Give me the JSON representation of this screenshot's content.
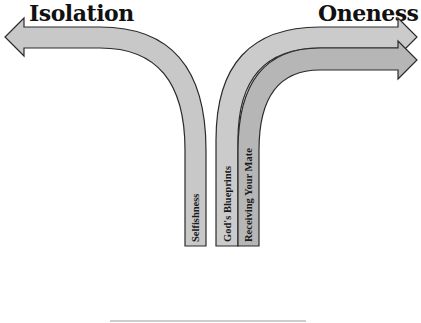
{
  "diagram": {
    "left_goal": "Isolation",
    "right_goal": "Oneness",
    "paths": [
      {
        "label": "Selfishness",
        "direction": "left",
        "leads_to": "Isolation"
      },
      {
        "label": "God's Blueprints",
        "direction": "right",
        "leads_to": "Oneness"
      },
      {
        "label": "Receiving Your Mate",
        "direction": "right",
        "leads_to": "Oneness"
      }
    ]
  },
  "colors": {
    "arrow_fill_light": "#c8c8c8",
    "arrow_fill_dark": "#b4b4b4",
    "arrow_stroke": "#2a2a2a",
    "text": "#111111",
    "baseline": "#bdbdbd"
  }
}
